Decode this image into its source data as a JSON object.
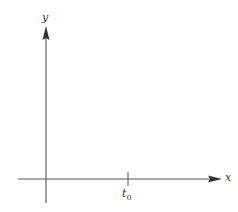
{
  "diagram": {
    "type": "coordinate-axes",
    "x_axis": {
      "label": "x",
      "arrow": true
    },
    "y_axis": {
      "label": "y",
      "arrow": true
    },
    "ticks": [
      {
        "axis": "x",
        "label_main": "t",
        "label_sub": "0"
      }
    ],
    "colors": {
      "axis": "#555555",
      "text": "#333333",
      "background": "#ffffff"
    }
  }
}
